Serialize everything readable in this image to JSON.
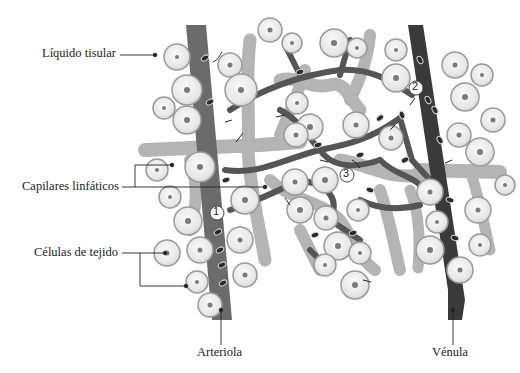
{
  "diagram": {
    "type": "anatomical illustration"
  },
  "labels": {
    "liquido_tisular": "Líquido tisular",
    "capilares_linfaticos": "Capilares linfáticos",
    "celulas_de_tejido": "Células de tejido",
    "arteriola": "Arteriola",
    "venula": "Vénula"
  },
  "markers": [
    "1",
    "2",
    "3"
  ],
  "colors": {
    "arteriole": "#6b6b6b",
    "venule": "#3a3a3a",
    "lymphatic": "#b4b4b4",
    "cell_fill": "#ececec",
    "cell_outline": "#9a9a9a",
    "nucleus": "#7a7a7a"
  }
}
